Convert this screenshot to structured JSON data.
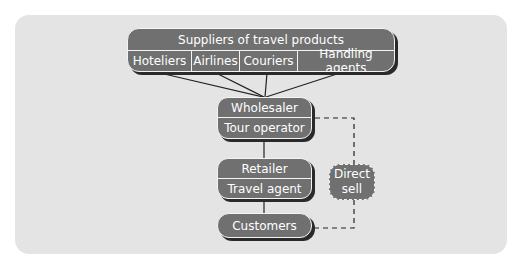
{
  "diagram": {
    "suppliers": {
      "title": "Suppliers of travel products",
      "items": [
        "Hoteliers",
        "Airlines",
        "Couriers",
        "Handling agents"
      ]
    },
    "wholesaler": {
      "top": "Wholesaler",
      "bottom": "Tour operator"
    },
    "retailer": {
      "top": "Retailer",
      "bottom": "Travel agent"
    },
    "customers": {
      "label": "Customers"
    },
    "direct_sell": {
      "line1": "Direct",
      "line2": "sell"
    },
    "colors": {
      "panel": "#e4e4e4",
      "box_fill": "#707070",
      "box_border": "#f4f4f4",
      "shadow": "#2a2a2a",
      "lines": "#222222"
    }
  }
}
